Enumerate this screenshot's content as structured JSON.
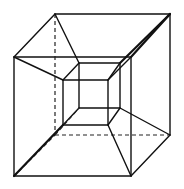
{
  "diagram": {
    "title": "",
    "colors": {
      "background": "#ffffff",
      "stroke": "#111111"
    },
    "outer_cube": {
      "front_face": [
        [
          14,
          57
        ],
        [
          131,
          57
        ],
        [
          131,
          176
        ],
        [
          14,
          176
        ]
      ],
      "back_face": [
        [
          55,
          14
        ],
        [
          170,
          14
        ],
        [
          170,
          135
        ],
        [
          55,
          135
        ]
      ],
      "hidden_edges_dashed": [
        [
          [
            55,
            14
          ],
          [
            55,
            135
          ]
        ],
        [
          [
            55,
            135
          ],
          [
            170,
            135
          ]
        ],
        [
          [
            14,
            176
          ],
          [
            55,
            135
          ]
        ]
      ]
    },
    "inner_cube": {
      "front_face": [
        [
          63,
          80
        ],
        [
          108,
          80
        ],
        [
          108,
          125
        ],
        [
          63,
          125
        ]
      ],
      "back_face": [
        [
          79,
          63
        ],
        [
          120,
          63
        ],
        [
          120,
          108
        ],
        [
          79,
          108
        ]
      ]
    },
    "connectors": [
      [
        [
          14,
          57
        ],
        [
          63,
          80
        ]
      ],
      [
        [
          55,
          14
        ],
        [
          79,
          63
        ]
      ],
      [
        [
          170,
          14
        ],
        [
          120,
          63
        ]
      ],
      [
        [
          131,
          57
        ],
        [
          108,
          80
        ]
      ],
      [
        [
          170,
          135
        ],
        [
          120,
          108
        ]
      ],
      [
        [
          131,
          176
        ],
        [
          108,
          125
        ]
      ],
      [
        [
          14,
          176
        ],
        [
          63,
          125
        ]
      ],
      [
        [
          55,
          135
        ],
        [
          79,
          108
        ]
      ]
    ]
  }
}
